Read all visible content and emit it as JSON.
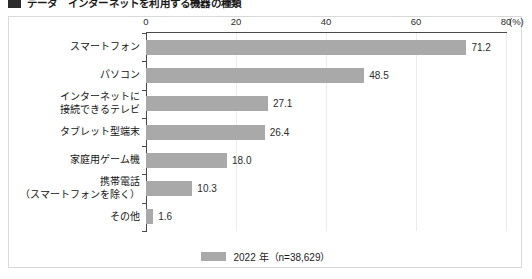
{
  "heading": {
    "text": "データ　インターネットを利用する機器の種類",
    "bullet_icon": "square-bullet-icon"
  },
  "chart_data": {
    "type": "bar",
    "orientation": "horizontal",
    "title": "",
    "xlabel": "(%)",
    "ylabel": "",
    "xlim": [
      0,
      80
    ],
    "xticks": [
      0,
      20,
      40,
      60,
      80
    ],
    "xtick_labels": [
      "0",
      "20",
      "40",
      "60",
      "80"
    ],
    "unit_label": "(%)",
    "grid": "vertical",
    "bar_color": "#a9a9a9",
    "categories": [
      "スマートフォン",
      "パソコン",
      "インターネットに\n接続できるテレビ",
      "タブレット型端末",
      "家庭用ゲーム機",
      "携帯電話\n（スマートフォンを除く）",
      "その他"
    ],
    "category_lines": [
      [
        "スマートフォン"
      ],
      [
        "パソコン"
      ],
      [
        "インターネットに",
        "接続できるテレビ"
      ],
      [
        "タブレット型端末"
      ],
      [
        "家庭用ゲーム機"
      ],
      [
        "携帯電話",
        "（スマートフォンを除く）"
      ],
      [
        "その他"
      ]
    ],
    "values": [
      71.2,
      48.5,
      27.1,
      26.4,
      18.0,
      10.3,
      1.6
    ],
    "value_labels": [
      "71.2",
      "48.5",
      "27.1",
      "26.4",
      "18.0",
      "10.3",
      "1.6"
    ],
    "series": [
      {
        "name": "2022 年（n=38,629）",
        "values": [
          71.2,
          48.5,
          27.1,
          26.4,
          18.0,
          10.3,
          1.6
        ]
      }
    ],
    "legend": {
      "position": "bottom-center",
      "entries": [
        {
          "label": "2022 年（n=38,629）",
          "color": "#a9a9a9"
        }
      ]
    }
  }
}
